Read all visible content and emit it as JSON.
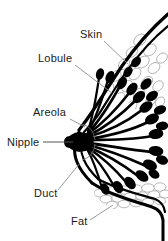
{
  "figure": {
    "background_color": "#ffffff",
    "ink_color": "#000000",
    "leader_color": "#8f8f8f",
    "tissue_color": "#9a9a9a",
    "width": 168,
    "height": 241
  },
  "labels": [
    {
      "id": "skin",
      "text": "Skin",
      "x": 80,
      "y": 38,
      "leader_from": [
        104,
        41
      ],
      "leader_to": [
        128,
        64
      ]
    },
    {
      "id": "lobule",
      "text": "Lobule",
      "x": 38,
      "y": 62,
      "leader_from": [
        75,
        65
      ],
      "leader_to": [
        112,
        93
      ]
    },
    {
      "id": "areola",
      "text": "Areola",
      "x": 33,
      "y": 116,
      "leader_from": [
        70,
        119
      ],
      "leader_to": [
        85,
        127
      ]
    },
    {
      "id": "nipple",
      "text": "Nipple",
      "x": 7,
      "y": 146,
      "leader_from": [
        43,
        142
      ],
      "leader_to": [
        73,
        142
      ]
    },
    {
      "id": "duct",
      "text": "Duct",
      "x": 34,
      "y": 197,
      "leader_from": [
        58,
        190
      ],
      "leader_to": [
        80,
        163
      ]
    },
    {
      "id": "fat",
      "text": "Fat",
      "x": 71,
      "y": 225,
      "leader_from": [
        90,
        220
      ],
      "leader_to": [
        113,
        205
      ]
    }
  ],
  "structures": [
    {
      "id": "skin-layer",
      "name": "skin",
      "description": "outer double contour line of the breast"
    },
    {
      "id": "fat-layer",
      "name": "fat",
      "description": "cellular adipose tissue beneath the skin"
    },
    {
      "id": "duct-system",
      "name": "duct",
      "description": "ducts radiating from the nipple"
    },
    {
      "id": "lobule-cluster",
      "name": "lobule",
      "description": "bulbous milk-producing lobules"
    },
    {
      "id": "nipple",
      "name": "nipple",
      "description": "nipple at the apex"
    },
    {
      "id": "areola",
      "name": "areola",
      "description": "areola region around the nipple"
    }
  ],
  "watermark": {
    "text": "",
    "visible": false
  }
}
